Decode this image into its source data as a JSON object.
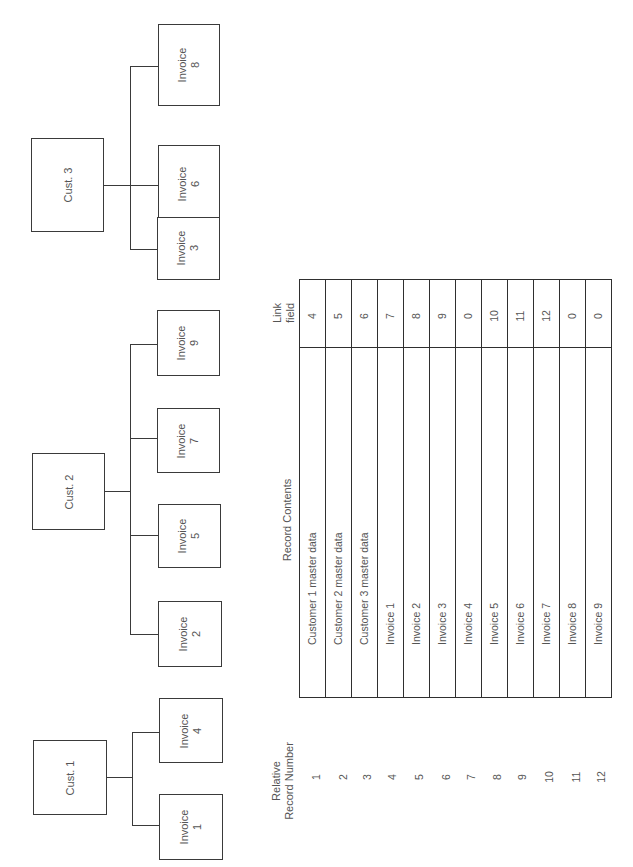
{
  "diagram": {
    "orientation": "rotated 90deg counter-clockwise",
    "hierarchy": [
      {
        "label": "Cust. 1",
        "children": [
          {
            "label": "Invoice\n1",
            "line1": "Invoice",
            "line2": "1"
          },
          {
            "label": "Invoice\n4",
            "line1": "Invoice",
            "line2": "4"
          }
        ]
      },
      {
        "label": "Cust. 2",
        "children": [
          {
            "line1": "Invoice",
            "line2": "2"
          },
          {
            "line1": "Invoice",
            "line2": "5"
          },
          {
            "line1": "Invoice",
            "line2": "7"
          },
          {
            "line1": "Invoice",
            "line2": "9"
          }
        ]
      },
      {
        "label": "Cust. 3",
        "children": [
          {
            "line1": "Invoice",
            "line2": "3"
          },
          {
            "line1": "Invoice",
            "line2": "6"
          },
          {
            "line1": "Invoice",
            "line2": "8"
          }
        ]
      }
    ],
    "table": {
      "headers": {
        "relative_record_number_line1": "Relative",
        "relative_record_number_line2": "Record Number",
        "record_contents": "Record Contents",
        "link_field_line1": "Link",
        "link_field_line2": "field"
      },
      "rows": [
        {
          "number": "1",
          "contents": "Customer 1 master data",
          "link": "4"
        },
        {
          "number": "2",
          "contents": "Customer 2 master data",
          "link": "5"
        },
        {
          "number": "3",
          "contents": "Customer 3 master data",
          "link": "6"
        },
        {
          "number": "4",
          "contents": "Invoice 1",
          "link": "7"
        },
        {
          "number": "5",
          "contents": "Invoice 2",
          "link": "8"
        },
        {
          "number": "6",
          "contents": "Invoice 3",
          "link": "9"
        },
        {
          "number": "7",
          "contents": "Invoice 4",
          "link": "0"
        },
        {
          "number": "8",
          "contents": "Invoice 5",
          "link": "10"
        },
        {
          "number": "9",
          "contents": "Invoice 6",
          "link": "11"
        },
        {
          "number": "10",
          "contents": "Invoice 7",
          "link": "12"
        },
        {
          "number": "11",
          "contents": "Invoice 8",
          "link": "0"
        },
        {
          "number": "12",
          "contents": "Invoice 9",
          "link": "0"
        }
      ]
    }
  }
}
